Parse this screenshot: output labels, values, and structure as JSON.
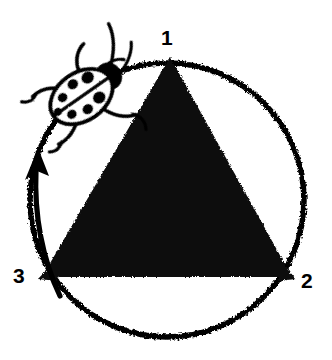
{
  "figure": {
    "background_color": "#ffffff",
    "ink_color": "#000000",
    "width": 332,
    "height": 360
  },
  "labels": {
    "vertex_1": "1",
    "vertex_2": "2",
    "vertex_3": "3"
  },
  "icons": {
    "ladybug": "ladybug-icon",
    "arrow": "curved-arrow-icon",
    "triangle": "filled-triangle-icon",
    "circle": "circle-outline-icon"
  },
  "geometry": {
    "circle": {
      "cx": 167,
      "cy": 200,
      "r": 137,
      "stroke_width": 5
    },
    "triangle": {
      "vertices": [
        {
          "name": "1",
          "x": 170,
          "y": 57
        },
        {
          "name": "2",
          "x": 292,
          "y": 277
        },
        {
          "name": "3",
          "x": 42,
          "y": 277
        }
      ],
      "fill": "#000000"
    },
    "arrow": {
      "direction": "counterclockwise-upward",
      "tip": {
        "x": 38,
        "y": 152
      },
      "tail": {
        "x": 57,
        "y": 292
      }
    },
    "ladybug": {
      "center_x": 88,
      "center_y": 92,
      "rotation_deg": -35
    }
  }
}
